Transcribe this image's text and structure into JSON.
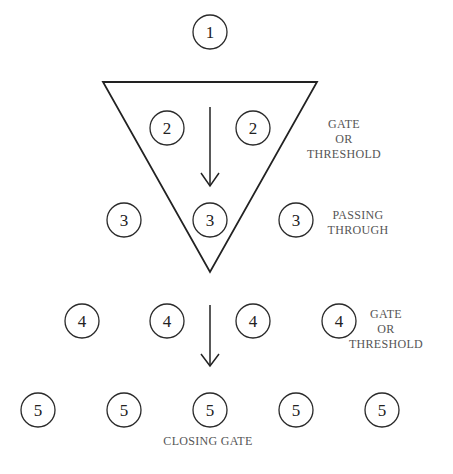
{
  "diagram": {
    "type": "stage-progression",
    "stages": [
      {
        "id": 1,
        "label": "1",
        "count": 1
      },
      {
        "id": 2,
        "label": "2",
        "count": 2
      },
      {
        "id": 3,
        "label": "3",
        "count": 3
      },
      {
        "id": 4,
        "label": "4",
        "count": 4
      },
      {
        "id": 5,
        "label": "5",
        "count": 5
      }
    ],
    "annotations": {
      "gate_top": [
        "GATE",
        "OR",
        "THRESHOLD"
      ],
      "passing": [
        "PASSING",
        "THROUGH"
      ],
      "gate_bottom": [
        "GATE",
        "OR",
        "THRESHOLD"
      ],
      "closing": "CLOSING GATE"
    },
    "arrows": [
      {
        "from_stage": 2,
        "to_stage": 3,
        "direction": "down"
      },
      {
        "from_stage": 4,
        "to_stage": 5,
        "direction": "down"
      }
    ],
    "shapes": [
      {
        "type": "inverted-triangle",
        "encloses_stages": [
          2,
          3
        ]
      }
    ]
  },
  "colors": {
    "stroke": "#222222",
    "label_text": "#555555",
    "background": "#ffffff"
  }
}
